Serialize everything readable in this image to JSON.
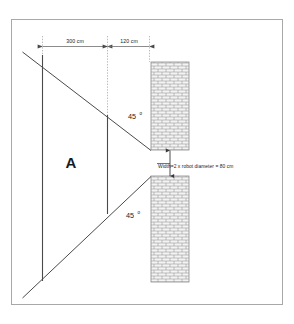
{
  "figure": {
    "background_color": "#ffffff",
    "frame_color": "#9a9a9a",
    "line_color": "#3a3a3a",
    "wall_fill": "#f2f2f2",
    "wall_stroke": "#8a8a8a"
  },
  "dimensions": [
    {
      "id": "dim-300",
      "label": "300 cm",
      "value": 300,
      "unit": "cm"
    },
    {
      "id": "dim-120",
      "label": "120 cm",
      "value": 120,
      "unit": "cm"
    }
  ],
  "angles": [
    {
      "id": "angle-upper",
      "value": "45",
      "symbol": "o",
      "label": "45 o"
    },
    {
      "id": "angle-lower",
      "value": "45",
      "symbol": "o",
      "label": "45 o"
    }
  ],
  "zones": [
    {
      "id": "zone-a",
      "label": "A"
    }
  ],
  "notes": [
    {
      "id": "gap-width-note",
      "label": "Width=2 x robot diameter  = 80 cm",
      "value": 80,
      "unit": "cm"
    }
  ],
  "walls": [
    {
      "id": "wall-upper",
      "pattern": "brick-hatch"
    },
    {
      "id": "wall-lower",
      "pattern": "brick-hatch"
    }
  ]
}
